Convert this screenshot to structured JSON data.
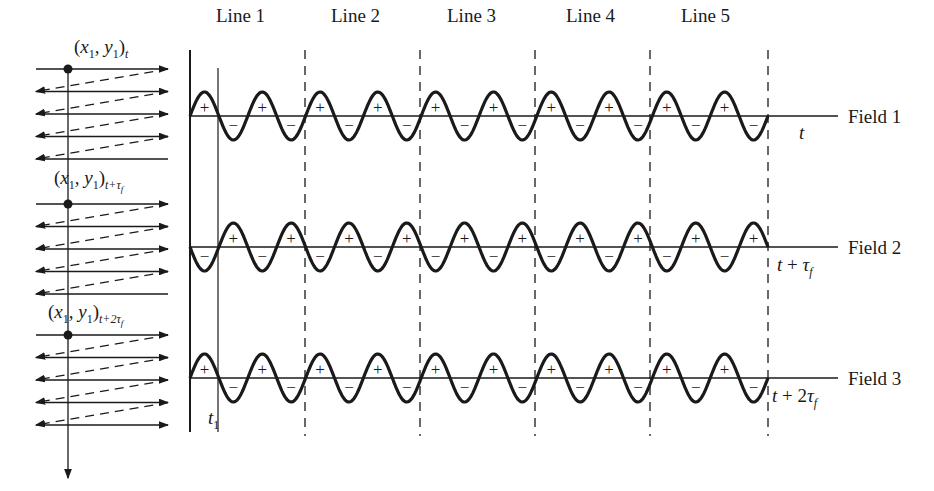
{
  "lines": [
    {
      "label": "Line 1",
      "x": 247
    },
    {
      "label": "Line 2",
      "x": 362
    },
    {
      "label": "Line 3",
      "x": 477
    },
    {
      "label": "Line 4",
      "x": 592
    },
    {
      "label": "Line 5",
      "x": 710
    }
  ],
  "fields": [
    {
      "label": "Field 1",
      "time_label": "t",
      "time_parts": {
        "base": "t",
        "op": "",
        "coef": "",
        "tau": "",
        "sub": ""
      },
      "axis_y": 116,
      "start_sign": "+"
    },
    {
      "label": "Field 2",
      "time_label": "t + τf",
      "time_parts": {
        "base": "t",
        "op": " + ",
        "coef": "",
        "tau": "τ",
        "sub": "f"
      },
      "axis_y": 247,
      "start_sign": "-"
    },
    {
      "label": "Field 3",
      "time_label": "t + 2τf",
      "time_parts": {
        "base": "t",
        "op": " + ",
        "coef": "2",
        "tau": "τ",
        "sub": "f"
      },
      "axis_y": 378,
      "start_sign": "+"
    }
  ],
  "scan_points": [
    {
      "label": "(x1, y1)t",
      "parts": {
        "x": "x",
        "xs": "1",
        "y": "y",
        "ys": "1",
        "t": "t",
        "tau": "",
        "tsub": ""
      }
    },
    {
      "label": "(x1, y1)t+τf",
      "parts": {
        "x": "x",
        "xs": "1",
        "y": "y",
        "ys": "1",
        "t": "t+",
        "tau": "τ",
        "tsub": "f"
      }
    },
    {
      "label": "(x1, y1)t+2τf",
      "parts": {
        "x": "x",
        "xs": "1",
        "y": "y",
        "ys": "1",
        "t": "t+2",
        "tau": "τ",
        "tsub": "f"
      }
    }
  ],
  "t1_marker": {
    "label": "t",
    "sub": "1"
  },
  "signs": {
    "plus": "+",
    "minus": "−"
  },
  "colors": {
    "ink": "#1a1a1a",
    "background": "#ffffff"
  }
}
